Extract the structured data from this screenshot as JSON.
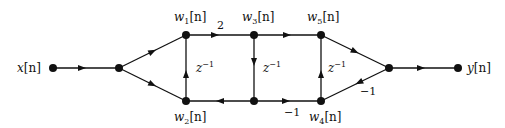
{
  "diagram": {
    "type": "signal-flow-graph",
    "nodes": [
      {
        "id": "x",
        "label": "x[n]",
        "x": 53,
        "y": 68
      },
      {
        "id": "split",
        "label": "",
        "x": 119,
        "y": 68
      },
      {
        "id": "w1",
        "label": "w1[n]",
        "x": 186,
        "y": 35
      },
      {
        "id": "w2",
        "label": "w2[n]",
        "x": 186,
        "y": 101
      },
      {
        "id": "w3",
        "label": "w3[n]",
        "x": 254,
        "y": 35
      },
      {
        "id": "b3",
        "label": "",
        "x": 254,
        "y": 101
      },
      {
        "id": "w5",
        "label": "w5[n]",
        "x": 321,
        "y": 35
      },
      {
        "id": "w4",
        "label": "w4[n]",
        "x": 321,
        "y": 101
      },
      {
        "id": "sum",
        "label": "",
        "x": 389,
        "y": 68
      },
      {
        "id": "y",
        "label": "y[n]",
        "x": 458,
        "y": 68
      }
    ],
    "edges": [
      {
        "from": "x",
        "to": "split",
        "gain": ""
      },
      {
        "from": "split",
        "to": "w1",
        "gain": ""
      },
      {
        "from": "split",
        "to": "w2",
        "gain": ""
      },
      {
        "from": "w2",
        "to": "w1",
        "gain": "z^-1"
      },
      {
        "from": "w1",
        "to": "w3",
        "gain": "2"
      },
      {
        "from": "w3",
        "to": "b3",
        "gain": "z^-1"
      },
      {
        "from": "b3",
        "to": "w2",
        "gain": ""
      },
      {
        "from": "b3",
        "to": "w4",
        "gain": "-1"
      },
      {
        "from": "w3",
        "to": "w5",
        "gain": ""
      },
      {
        "from": "w4",
        "to": "w5",
        "gain": "z^-1"
      },
      {
        "from": "w5",
        "to": "sum",
        "gain": ""
      },
      {
        "from": "w4",
        "to": "sum",
        "gain": "-1"
      },
      {
        "from": "sum",
        "to": "y",
        "gain": ""
      }
    ],
    "labels": {
      "input": {
        "base": "x",
        "arg": "[n]"
      },
      "output": {
        "base": "y",
        "arg": "[n]"
      },
      "w1": {
        "base": "w",
        "sub": "1",
        "arg": "[n]"
      },
      "w2": {
        "base": "w",
        "sub": "2",
        "arg": "[n]"
      },
      "w3": {
        "base": "w",
        "sub": "3",
        "arg": "[n]"
      },
      "w4": {
        "base": "w",
        "sub": "4",
        "arg": "[n]"
      },
      "w5": {
        "base": "w",
        "sub": "5",
        "arg": "[n]"
      }
    },
    "gains": {
      "g_w1_w3": "2",
      "delay_base": "z",
      "delay_exp": "−1",
      "g_b3_w4": "−1",
      "g_w4_sum": "−1"
    }
  }
}
